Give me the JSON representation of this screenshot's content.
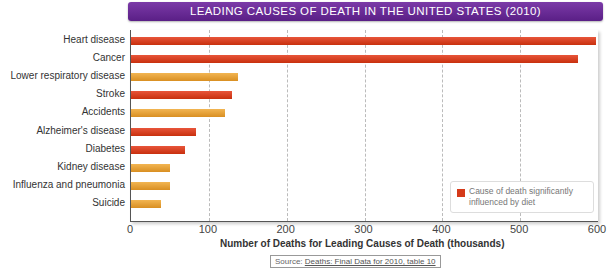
{
  "chart_data": {
    "type": "bar",
    "orientation": "horizontal",
    "title": "LEADING CAUSES OF DEATH IN THE UNITED STATES (2010)",
    "xlabel": "Number of Deaths for Leading Causes of Death (thousands)",
    "ylabel": "",
    "xlim": [
      0,
      600
    ],
    "xticks": [
      0,
      100,
      200,
      300,
      400,
      500,
      600
    ],
    "grid": true,
    "categories": [
      "Heart disease",
      "Cancer",
      "Lower respiratory disease",
      "Stroke",
      "Accidents",
      "Alzheimer's disease",
      "Diabetes",
      "Kidney disease",
      "Influenza and pneumonia",
      "Suicide"
    ],
    "values": [
      597.7,
      574.7,
      138.1,
      129.5,
      120.9,
      83.5,
      69.1,
      50.5,
      50.1,
      38.4
    ],
    "diet_influenced": [
      true,
      true,
      false,
      true,
      false,
      true,
      true,
      false,
      false,
      false
    ],
    "colors": {
      "diet": "#d53a1a",
      "other": "#e6a23a"
    },
    "legend": {
      "position": "lower right",
      "entries": [
        "Cause of death significantly influenced by diet"
      ]
    }
  },
  "source": {
    "prefix": "Source: ",
    "link": "Deaths: Final Data for 2010, table 10"
  }
}
